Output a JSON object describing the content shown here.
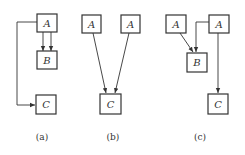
{
  "panels": [
    {
      "caption": "(a)",
      "nodes": [
        {
          "id": "A",
          "label": "A"
        },
        {
          "id": "B",
          "label": "B"
        },
        {
          "id": "C",
          "label": "C"
        }
      ],
      "edges": [
        {
          "from": "A",
          "to": "B"
        },
        {
          "from": "A",
          "to": "B"
        },
        {
          "from": "A",
          "to": "C"
        }
      ]
    },
    {
      "caption": "(b)",
      "nodes": [
        {
          "id": "A1",
          "label": "A"
        },
        {
          "id": "A2",
          "label": "A"
        },
        {
          "id": "C",
          "label": "C"
        }
      ],
      "edges": [
        {
          "from": "A1",
          "to": "C"
        },
        {
          "from": "A2",
          "to": "C"
        }
      ]
    },
    {
      "caption": "(c)",
      "nodes": [
        {
          "id": "A1",
          "label": "A"
        },
        {
          "id": "A2",
          "label": "A"
        },
        {
          "id": "B",
          "label": "B"
        },
        {
          "id": "C",
          "label": "C"
        }
      ],
      "edges": [
        {
          "from": "A1",
          "to": "B"
        },
        {
          "from": "A2",
          "to": "B"
        },
        {
          "from": "A2",
          "to": "C"
        }
      ]
    }
  ]
}
